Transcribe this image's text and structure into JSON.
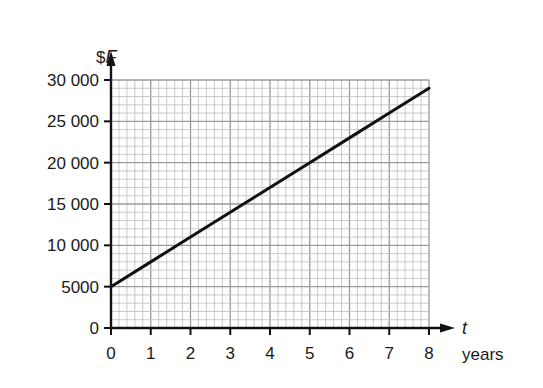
{
  "chart_data": {
    "type": "line",
    "title": "",
    "xlabel": "t",
    "xlabel_units": "years",
    "ylabel": "$F",
    "ylabel_prefix": "$",
    "ylabel_var": "F",
    "x": [
      0,
      1,
      2,
      3,
      4,
      5,
      6,
      7,
      8
    ],
    "series": [
      {
        "name": "F",
        "values": [
          5000,
          8000,
          11000,
          14000,
          17000,
          20000,
          23000,
          26000,
          29000
        ]
      }
    ],
    "xlim": [
      0,
      8
    ],
    "ylim": [
      0,
      30000
    ],
    "x_ticks": [
      0,
      1,
      2,
      3,
      4,
      5,
      6,
      7,
      8
    ],
    "x_tick_labels": [
      "0",
      "1",
      "2",
      "3",
      "4",
      "5",
      "6",
      "7",
      "8"
    ],
    "y_ticks": [
      0,
      5000,
      10000,
      15000,
      20000,
      25000,
      30000
    ],
    "y_tick_labels": [
      "0",
      "5000",
      "10 000",
      "15 000",
      "20 000",
      "25 000",
      "30 000"
    ],
    "grid": {
      "on": true,
      "major_x_step": 1,
      "minor_x_step": 0.2,
      "major_y_step": 5000,
      "minor_y_step": 1000
    },
    "legend": null
  },
  "colors": {
    "line": "#111111",
    "axis": "#111111",
    "grid_major": "#9a9a9a",
    "grid_minor": "#c4c4c4",
    "background": "#ffffff"
  }
}
